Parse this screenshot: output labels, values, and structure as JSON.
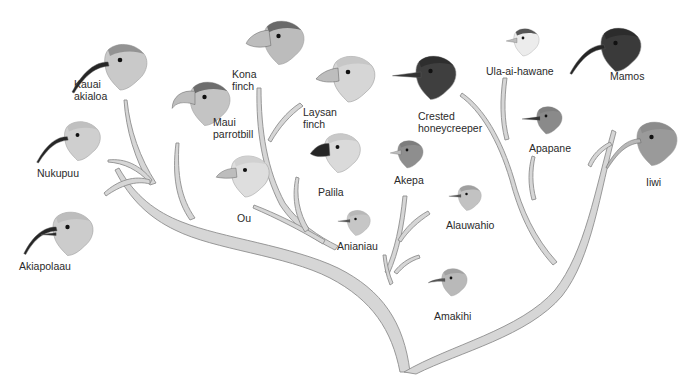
{
  "figure": {
    "colors": {
      "branch_fill": "#d6d6d6",
      "branch_stroke": "#8f8f8f",
      "text": "#2a2a2a",
      "background": "#ffffff"
    }
  },
  "species": [
    {
      "id": "kauai-akialoa",
      "label": "Kauai\nakialoa",
      "beak": "long-curved",
      "head_tone": "#c9c9c9",
      "cap": "#8a8a8a",
      "x": 70,
      "y": 40,
      "scale": 1.0,
      "label_x": 74,
      "label_y": 78
    },
    {
      "id": "nukupuu",
      "label": "Nukupuu",
      "beak": "long-curved",
      "head_tone": "#cfcfcf",
      "cap": "#bdbdbd",
      "x": 35,
      "y": 118,
      "scale": 0.85,
      "label_x": 37,
      "label_y": 167
    },
    {
      "id": "akiapolaau",
      "label": "Akiapolaau",
      "beak": "split-curved",
      "head_tone": "#cccccc",
      "cap": "#bababa",
      "x": 20,
      "y": 208,
      "scale": 0.95,
      "label_x": 19,
      "label_y": 260
    },
    {
      "id": "maui-parrotbill",
      "label": "Maui\nparrotbill",
      "beak": "parrot",
      "head_tone": "#c4c4c4",
      "cap": "#5e5e5e",
      "x": 157,
      "y": 78,
      "scale": 0.95,
      "label_x": 213,
      "label_y": 116
    },
    {
      "id": "kona-finch",
      "label": "Kona\nfinch",
      "beak": "heavy-finch",
      "head_tone": "#bcbcbc",
      "cap": "#5a5a5a",
      "x": 231,
      "y": 17,
      "scale": 0.95,
      "label_x": 232,
      "label_y": 68
    },
    {
      "id": "laysan-finch",
      "label": "Laysan\nfinch",
      "beak": "finch",
      "head_tone": "#d6d6d6",
      "cap": "#c4c4c4",
      "x": 298,
      "y": 52,
      "scale": 1.0,
      "label_x": 303,
      "label_y": 106
    },
    {
      "id": "ou",
      "label": "Ou",
      "beak": "hooked-short",
      "head_tone": "#dedede",
      "cap": "#cfcfcf",
      "x": 200,
      "y": 152,
      "scale": 0.9,
      "label_x": 237,
      "label_y": 212
    },
    {
      "id": "palila",
      "label": "Palila",
      "beak": "dark-finch",
      "head_tone": "#dadada",
      "cap": "#c6c6c6",
      "x": 295,
      "y": 130,
      "scale": 0.85,
      "label_x": 318,
      "label_y": 186
    },
    {
      "id": "akepa",
      "label": "Akepa",
      "beak": "small-conical",
      "head_tone": "#8e8e8e",
      "cap": "#7a7a7a",
      "x": 377,
      "y": 138,
      "scale": 0.6,
      "label_x": 394,
      "label_y": 174
    },
    {
      "id": "anianiau",
      "label": "Anianiau",
      "beak": "thin-short",
      "head_tone": "#c6c6c6",
      "cap": "#b5b5b5",
      "x": 328,
      "y": 208,
      "scale": 0.55,
      "label_x": 337,
      "label_y": 240
    },
    {
      "id": "crested-honeycreeper",
      "label": "Crested\nhoneycreeper",
      "beak": "thin-medium",
      "head_tone": "#3f3f3f",
      "cap": "#2c2c2c",
      "x": 383,
      "y": 52,
      "scale": 0.95,
      "label_x": 418,
      "label_y": 110
    },
    {
      "id": "alauwahio",
      "label": "Alauwahio",
      "beak": "thin-short",
      "head_tone": "#c2c2c2",
      "cap": "#9a9a9a",
      "x": 439,
      "y": 183,
      "scale": 0.55,
      "label_x": 446,
      "label_y": 219
    },
    {
      "id": "amakihi",
      "label": "Amakihi",
      "beak": "thin-curved",
      "head_tone": "#b9b9b9",
      "cap": "#9d9d9d",
      "x": 421,
      "y": 266,
      "scale": 0.6,
      "label_x": 434,
      "label_y": 310
    },
    {
      "id": "ula-ai-hawane",
      "label": "Ula-ai-hawane",
      "beak": "small-conical",
      "head_tone": "#ececec",
      "cap": "#3c3c3c",
      "x": 493,
      "y": 26,
      "scale": 0.6,
      "label_x": 486,
      "label_y": 65
    },
    {
      "id": "apapane",
      "label": "Apapane",
      "beak": "thin-medium",
      "head_tone": "#8a8a8a",
      "cap": "#7c7c7c",
      "x": 516,
      "y": 104,
      "scale": 0.6,
      "label_x": 529,
      "label_y": 142
    },
    {
      "id": "mamos",
      "label": "Mamos",
      "beak": "long-curved",
      "head_tone": "#3a3a3a",
      "cap": "#2a2a2a",
      "x": 568,
      "y": 24,
      "scale": 0.95,
      "label_x": 610,
      "label_y": 70
    },
    {
      "id": "iiwi",
      "label": "Iiwi",
      "beak": "long-curved-pale",
      "head_tone": "#9a9a9a",
      "cap": "#8a8a8a",
      "x": 604,
      "y": 118,
      "scale": 0.95,
      "label_x": 646,
      "label_y": 176
    }
  ]
}
